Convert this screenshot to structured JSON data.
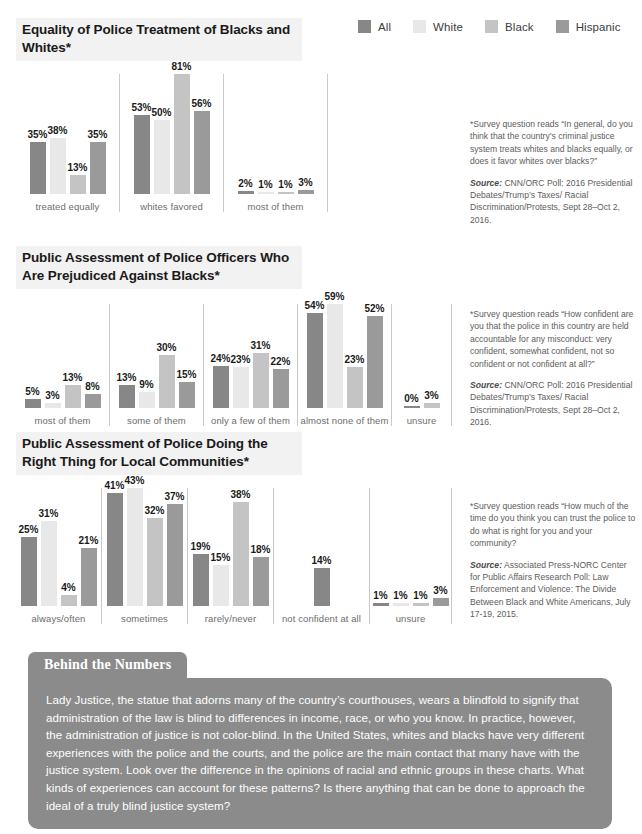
{
  "legend": {
    "items": [
      {
        "label": "All",
        "color": "#878787"
      },
      {
        "label": "White",
        "color": "#e8e8e8"
      },
      {
        "label": "Black",
        "color": "#c4c4c4"
      },
      {
        "label": "Hispanic",
        "color": "#9a9a9a"
      }
    ]
  },
  "chart_data": [
    {
      "type": "bar",
      "title": "Equality of Police Treatment of Blacks and Whites*",
      "categories": [
        "treated equally",
        "whites favored",
        "most of them"
      ],
      "series": [
        {
          "name": "All",
          "color": "#878787",
          "values": [
            35,
            53,
            2
          ]
        },
        {
          "name": "White",
          "color": "#e8e8e8",
          "values": [
            38,
            50,
            1
          ]
        },
        {
          "name": "Black",
          "color": "#c4c4c4",
          "values": [
            13,
            81,
            1
          ]
        },
        {
          "name": "Hispanic",
          "color": "#9a9a9a",
          "values": [
            35,
            56,
            3
          ]
        }
      ],
      "value_suffix": "%",
      "ylim": [
        0,
        81
      ],
      "xlabel": "",
      "ylabel": "",
      "grid": false,
      "legend_position": "top-right",
      "note": "*Survey question reads “In general, do you think that the country’s criminal justice system treats whites and blacks equally, or does it favor whites over blacks?”",
      "source_label": "Source:",
      "source": "CNN/ORC Poll: 2016 Presidential Debates/Trump’s Taxes/ Racial Discrimination/Protests, Sept 28–Oct 2, 2016."
    },
    {
      "type": "bar",
      "title": "Public Assessment of Police Officers Who Are Prejudiced Against Blacks*",
      "categories": [
        "most of them",
        "some of them",
        "only a few of them",
        "almost none of them",
        "unsure"
      ],
      "series": [
        {
          "name": "All",
          "color": "#878787",
          "values": [
            5,
            13,
            24,
            54,
            0
          ]
        },
        {
          "name": "White",
          "color": "#e8e8e8",
          "values": [
            3,
            9,
            23,
            59,
            null
          ]
        },
        {
          "name": "Black",
          "color": "#c4c4c4",
          "values": [
            13,
            30,
            31,
            23,
            3
          ]
        },
        {
          "name": "Hispanic",
          "color": "#9a9a9a",
          "values": [
            8,
            15,
            22,
            52,
            null
          ]
        }
      ],
      "value_suffix": "%",
      "ylim": [
        0,
        59
      ],
      "xlabel": "",
      "ylabel": "",
      "grid": false,
      "legend_position": "top-right",
      "note": "*Survey question reads “How confident are you that the police in this country are held accountable for any misconduct: very confident, somewhat confident, not so confident or not confident at all?”",
      "source_label": "Source:",
      "source": "CNN/ORC Poll: 2016 Presidential Debates/Trump’s Taxes/ Racial Discrimination/Protests, Sept 28–Oct 2, 2016."
    },
    {
      "type": "bar",
      "title": "Public Assessment of Police Doing the Right Thing for Local Communities*",
      "categories": [
        "always/often",
        "sometimes",
        "rarely/never",
        "not confident at all",
        "unsure"
      ],
      "series": [
        {
          "name": "All",
          "color": "#878787",
          "values": [
            25,
            41,
            19,
            14,
            1
          ]
        },
        {
          "name": "White",
          "color": "#e8e8e8",
          "values": [
            31,
            43,
            15,
            null,
            1
          ]
        },
        {
          "name": "Black",
          "color": "#c4c4c4",
          "values": [
            4,
            32,
            38,
            null,
            1
          ]
        },
        {
          "name": "Hispanic",
          "color": "#9a9a9a",
          "values": [
            21,
            37,
            18,
            null,
            3
          ]
        }
      ],
      "value_suffix": "%",
      "ylim": [
        0,
        43
      ],
      "xlabel": "",
      "ylabel": "",
      "grid": false,
      "legend_position": "top-right",
      "note": "*Survey question reads “How much of the time do you think you can trust the police to do what is right for you and your community?",
      "source_label": "Source:",
      "source": "Associated Press-NORC Center for Public Affairs Research Poll: Law Enforcement and Violence: The Divide Between Black and White Americans, July 17-19, 2015."
    }
  ],
  "behind_the_numbers": {
    "tab_label": "Behind the Numbers",
    "body": "Lady Justice, the statue that adorns many of the country’s courthouses, wears a blindfold to signify that administration of the law is blind to differences in income, race, or who you know. In practice, however, the administration of justice is not color-blind. In the United States, whites and blacks have very different experiences with the police and the courts, and the police are the main contact that many have with the justice system. Look over the difference in the opinions of racial and ethnic groups in these charts. What kinds of experiences can account for these patterns? Is there anything that can be done to approach the ideal of a truly blind justice system?"
  }
}
